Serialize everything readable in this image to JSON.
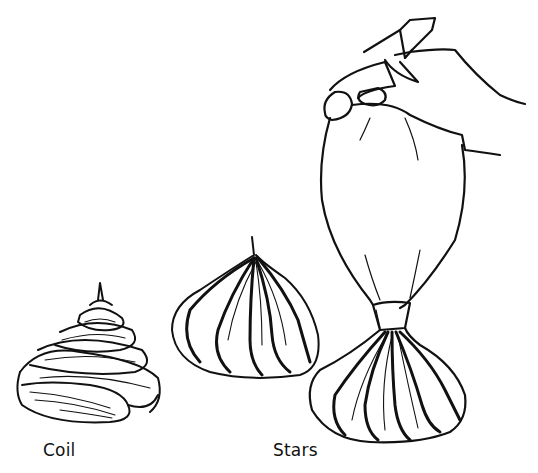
{
  "illustration": {
    "subject": "piping meringue shapes with a piping bag",
    "captions": {
      "coil": "Coil",
      "stars": "Stars"
    },
    "figures": [
      {
        "name": "coil-meringue",
        "label_ref": "captions.coil"
      },
      {
        "name": "star-meringue",
        "label_ref": "captions.stars"
      },
      {
        "name": "piping-bag-with-hand",
        "label_ref": "captions.stars"
      }
    ],
    "colors": {
      "ink": "#111111",
      "paper": "#ffffff"
    }
  }
}
